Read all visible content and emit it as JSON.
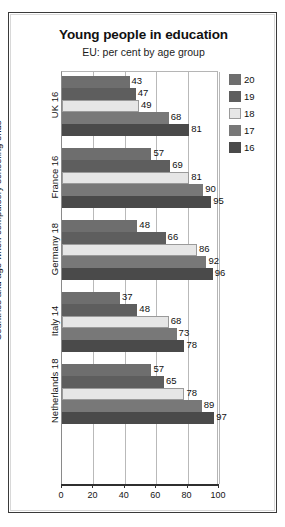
{
  "chart_data": {
    "type": "bar",
    "orientation": "horizontal",
    "title": "Young people in education",
    "subtitle": "EU: per cent by age group",
    "xlabel": "",
    "ylabel": "Countries and age when compulsory schooling ends",
    "xlim": [
      0,
      100
    ],
    "xticks": [
      "0",
      "20",
      "40",
      "60",
      "80",
      "100"
    ],
    "grid": true,
    "legend_position": "right",
    "categories": [
      "UK 16",
      "France 16",
      "Germany 18",
      "Italy 14",
      "Netherlands 18"
    ],
    "series": [
      {
        "name": "20",
        "color": "#6e6e6e",
        "values": [
          43,
          57,
          48,
          37,
          57
        ]
      },
      {
        "name": "19",
        "color": "#5e5e5e",
        "values": [
          47,
          69,
          66,
          48,
          65
        ]
      },
      {
        "name": "18",
        "color": "#e6e6e6",
        "values": [
          49,
          81,
          86,
          68,
          78
        ]
      },
      {
        "name": "17",
        "color": "#787878",
        "values": [
          68,
          90,
          92,
          73,
          89
        ]
      },
      {
        "name": "16",
        "color": "#4a4a4a",
        "values": [
          81,
          95,
          96,
          78,
          97
        ]
      }
    ]
  },
  "legend": {
    "items": [
      {
        "label": "20",
        "color": "#6e6e6e"
      },
      {
        "label": "19",
        "color": "#5e5e5e"
      },
      {
        "label": "18",
        "color": "#e6e6e6"
      },
      {
        "label": "17",
        "color": "#787878"
      },
      {
        "label": "16",
        "color": "#4a4a4a"
      }
    ]
  },
  "colors": {
    "frame": "#3a3a3a",
    "axis": "#2f2f2f",
    "grid": "#b9b9b9",
    "text": "#111111",
    "background": "#ffffff"
  }
}
